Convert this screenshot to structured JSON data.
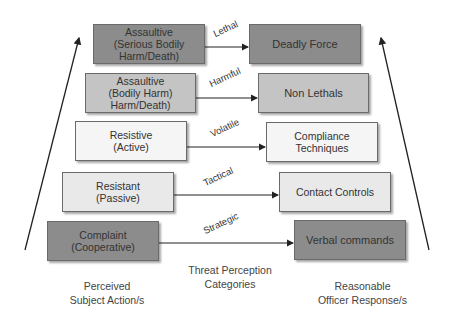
{
  "diagram": {
    "colors": {
      "dark": "#8c8c8c",
      "medium": "#c4c4c4",
      "light": "#e9e9e9",
      "lightest": "#f5f5f5",
      "line": "#222222"
    },
    "subject_actions": [
      {
        "label": "Assaultive\n(Serious Bodily\nHarm/Death)",
        "shade": "dark"
      },
      {
        "label": "Assaultive\n(Bodily Harm)\nHarm/Death)",
        "shade": "medium"
      },
      {
        "label": "Resistive\n(Active)",
        "shade": "lightest"
      },
      {
        "label": "Resistant\n(Passive)",
        "shade": "light"
      },
      {
        "label": "Complaint\n(Cooperative)",
        "shade": "dark"
      }
    ],
    "threat_categories": [
      "Lethal",
      "Harmful",
      "Volatile",
      "Tactical",
      "Strategic"
    ],
    "officer_responses": [
      {
        "label": "Deadly Force",
        "shade": "dark"
      },
      {
        "label": "Non Lethals",
        "shade": "medium"
      },
      {
        "label": "Compliance Techniques",
        "shade": "lightest"
      },
      {
        "label": "Contact Controls",
        "shade": "light"
      },
      {
        "label": "Verbal commands",
        "shade": "dark"
      }
    ],
    "captions": {
      "left": "Perceived\nSubject Action/s",
      "center": "Threat Perception\nCategories",
      "right": "Reasonable\nOfficer Response/s"
    }
  }
}
